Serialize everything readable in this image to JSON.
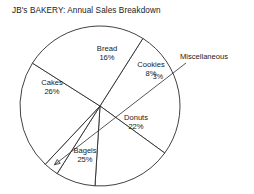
{
  "chart_data": {
    "type": "pie",
    "title": "JB's BAKERY: Annual Sales Breakdown",
    "xlabel": "",
    "ylabel": "",
    "legend_position": "none",
    "grid": false,
    "value_unit": "percent",
    "total": 100,
    "categories": [
      "Cakes",
      "Bread",
      "Cookies",
      "Miscellaneous",
      "Donuts",
      "Bagels"
    ],
    "values": [
      26,
      16,
      8,
      3,
      22,
      25
    ],
    "slices": [
      {
        "name": "Cakes",
        "value": 26,
        "value_text": "26%",
        "label_placement": "inside",
        "label_x": 52,
        "label_y": 78
      },
      {
        "name": "Bread",
        "value": 16,
        "value_text": "16%",
        "label_placement": "inside",
        "label_x": 107,
        "label_y": 44
      },
      {
        "name": "Cookies",
        "value": 8,
        "value_text": "8%",
        "label_placement": "inside",
        "label_x": 151,
        "label_y": 60
      },
      {
        "name": "Miscellaneous",
        "value": 3,
        "value_text": "3%",
        "label_placement": "callout",
        "label_x": 204,
        "label_y": 52,
        "pct_x": 158,
        "pct_y": 73
      },
      {
        "name": "Donuts",
        "value": 22,
        "value_text": "22%",
        "label_placement": "inside",
        "label_x": 136,
        "label_y": 113
      },
      {
        "name": "Bagels",
        "value": 25,
        "value_text": "25%",
        "label_placement": "inside",
        "label_x": 85,
        "label_y": 146
      }
    ],
    "geometry": {
      "center_x": 100,
      "center_y": 106,
      "radius": 80,
      "start_angle_deg": -57.6,
      "direction": "clockwise"
    },
    "colors": {
      "slice_fill": "#ffffff",
      "slice_outline": "#2b2b2b",
      "text": "#1a1a1a",
      "background": "#ffffff"
    }
  }
}
